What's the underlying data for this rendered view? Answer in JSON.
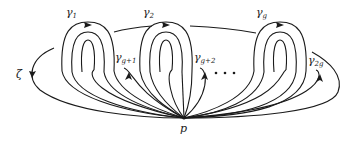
{
  "diagram": {
    "type": "surface-loop-diagram",
    "base_point": {
      "label": "p",
      "x": 184,
      "y": 118
    },
    "outer_curve": {
      "label": "ζ",
      "label_x": 16,
      "label_y": 78
    },
    "loops_top": [
      {
        "name": "γ",
        "sub": "1",
        "label_x": 66,
        "label_y": 16,
        "cx": 88
      },
      {
        "name": "γ",
        "sub": "2",
        "label_x": 143,
        "label_y": 16,
        "cx": 165
      },
      {
        "name": "γ",
        "sub": "g",
        "label_x": 256,
        "label_y": 16,
        "cx": 280
      }
    ],
    "loops_inner": [
      {
        "name": "γ",
        "sub": "g+1",
        "label_x": 115,
        "label_y": 61
      },
      {
        "name": "γ",
        "sub": "g+2",
        "label_x": 194,
        "label_y": 61
      },
      {
        "name": "γ",
        "sub": "2g",
        "label_x": 308,
        "label_y": 64
      }
    ],
    "ellipsis": "• • •"
  }
}
